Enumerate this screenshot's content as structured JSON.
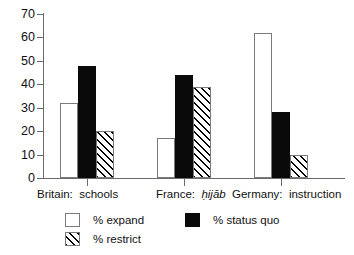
{
  "chart_data": {
    "type": "bar",
    "title": "",
    "subtitle": "",
    "xlabel": "",
    "ylabel": "",
    "ylim": [
      0,
      70
    ],
    "ytick_step": 10,
    "yticks": [
      "70",
      "60",
      "50",
      "40",
      "30",
      "20",
      "10",
      "0"
    ],
    "grid": false,
    "legend_position": "bottom-left",
    "categories": [
      "Britain:  schools",
      "France:  ḥijāb",
      "Germany:  instruction"
    ],
    "category_parts": [
      {
        "country": "Britain:",
        "term": "schools",
        "term_italic": false
      },
      {
        "country": "France:",
        "term": "ḥijāb",
        "term_italic": true
      },
      {
        "country": "Germany:",
        "term": "instruction",
        "term_italic": false
      }
    ],
    "series": [
      {
        "name": "% expand",
        "key": "expand",
        "fill": "white",
        "values": [
          32,
          17,
          62
        ]
      },
      {
        "name": "% status quo",
        "key": "status",
        "fill": "black",
        "values": [
          48,
          44,
          28
        ]
      },
      {
        "name": "% restrict",
        "key": "restrict",
        "fill": "hatched",
        "values": [
          20,
          39,
          10
        ]
      }
    ]
  },
  "legend": {
    "items": [
      {
        "label": "% expand",
        "swatch": "white-square-swatch"
      },
      {
        "label": "% status quo",
        "swatch": "black-square-swatch"
      },
      {
        "label": "% restrict",
        "swatch": "hatched-square-swatch"
      }
    ]
  },
  "colors": {
    "bar_white": "#ffffff",
    "bar_black": "#0a0a0a",
    "hatch_line": "#000000",
    "axis": "#6b6b6b",
    "text": "#111111",
    "background": "#ffffff"
  }
}
